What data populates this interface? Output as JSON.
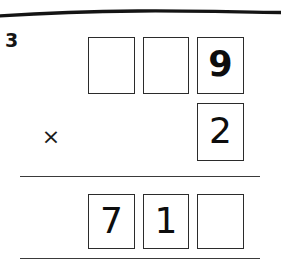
{
  "worksheet": {
    "problem_number": "3",
    "operator_symbol": "×",
    "top_divider": "hand-drawn-horizontal-line",
    "colors": {
      "ink": "#1a1a1a",
      "box_border": "#2b2b2b",
      "rule": "#3a3a3a",
      "paper": "#ffffff"
    }
  },
  "problem": {
    "type": "long-multiplication",
    "multiplicand_row": {
      "label": "multiplicand",
      "cells": [
        {
          "position": "hundreds",
          "value": "",
          "filled": false
        },
        {
          "position": "tens",
          "value": "",
          "filled": false
        },
        {
          "position": "ones",
          "value": "9",
          "filled": true,
          "style": "script"
        }
      ]
    },
    "multiplier_row": {
      "label": "multiplier",
      "operator": "×",
      "cells": [
        {
          "position": "ones",
          "value": "2",
          "filled": true,
          "style": "print"
        }
      ]
    },
    "product_row": {
      "label": "product",
      "cells": [
        {
          "position": "hundreds",
          "value": "7",
          "filled": true,
          "style": "print"
        },
        {
          "position": "tens",
          "value": "1",
          "filled": true,
          "style": "print"
        },
        {
          "position": "ones",
          "value": "",
          "filled": false
        }
      ]
    }
  }
}
